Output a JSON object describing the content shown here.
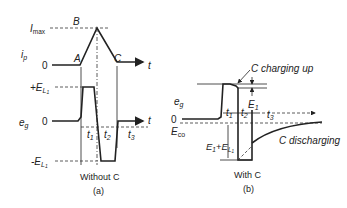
{
  "panel_a": {
    "ip_axis_label": "i",
    "ip_axis_sub": "p",
    "imax_label": "I",
    "imax_sub": "max",
    "point_A": "A",
    "point_B": "B",
    "point_C": "C",
    "zero_top": "0",
    "t_top": "t",
    "eg_axis_label": "e",
    "eg_axis_sub": "g",
    "plus_EL_label": "+E",
    "plus_EL_sub": "L",
    "plus_EL_sub2": "1",
    "minus_EL_label": "-E",
    "minus_EL_sub": "L",
    "minus_EL_sub2": "1",
    "zero_bottom": "0",
    "t_bottom": "t",
    "t1": "t",
    "t1_sub": "1",
    "t2": "t",
    "t2_sub": "2",
    "t3": "t",
    "t3_sub": "3",
    "caption_title": "Without C",
    "caption_id": "(a)"
  },
  "panel_b": {
    "charging_label": "C charging up",
    "eg_axis_label": "e",
    "eg_axis_sub": "g",
    "zero": "0",
    "eco_label": "E",
    "eco_sub": "co",
    "e1_label": "E",
    "e1_sub": "1",
    "t1": "t",
    "t1_sub": "1",
    "t2": "t",
    "t2_sub": "2",
    "t3": "t",
    "t3_sub": "3",
    "sum_label_a": "E",
    "sum_label_a_sub": "1",
    "sum_plus": "+",
    "sum_label_b": "E",
    "sum_label_b_sub": "L",
    "sum_label_b_sub2": "1",
    "discharging_label": "C discharging",
    "caption_title": "With C",
    "caption_id": "(b)"
  }
}
